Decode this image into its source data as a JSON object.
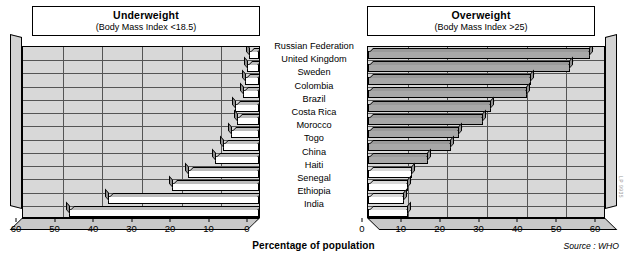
{
  "chart_data": {
    "type": "bar",
    "xlabel": "Percentage of population",
    "ylabel": "",
    "source": "Source : WHO",
    "orientation": "horizontal",
    "categories": [
      "Russian Federation",
      "United Kingdom",
      "Sweden",
      "Colombia",
      "Brazil",
      "Costa Rica",
      "Morocco",
      "Togo",
      "China",
      "Haiti",
      "Senegal",
      "Ethiopia",
      "India"
    ],
    "panels": [
      {
        "id": "underweight",
        "title": "Underweight",
        "subtitle": "(Body Mass Index <18.5)",
        "axis_direction": "reversed",
        "xlim": [
          60,
          0
        ],
        "ticks": [
          60,
          50,
          40,
          30,
          20,
          10,
          0
        ],
        "values": [
          2.5,
          3.0,
          3.5,
          4.0,
          6.0,
          5.5,
          7.0,
          9.0,
          11.0,
          18.0,
          22.0,
          38.0,
          48.0
        ]
      },
      {
        "id": "overweight",
        "title": "Overweight",
        "subtitle": "(Body Mass Index >25)",
        "axis_direction": "normal",
        "xlim": [
          0,
          60
        ],
        "ticks": [
          0,
          10,
          20,
          30,
          40,
          50,
          60
        ],
        "values": [
          56.0,
          51.0,
          41.0,
          40.0,
          31.0,
          29.0,
          23.0,
          21.0,
          15.0,
          11.0,
          10.0,
          9.0,
          10.0
        ]
      }
    ],
    "gridlines": {
      "vertical": true,
      "horizontal": true
    },
    "legend": "none"
  },
  "figure": {
    "reference_code": "LP 9935"
  },
  "axis_ticks_left": [
    "60",
    "50",
    "40",
    "30",
    "20",
    "10",
    "0"
  ],
  "axis_ticks_right": [
    "0",
    "10",
    "20",
    "30",
    "40",
    "50",
    "60"
  ]
}
